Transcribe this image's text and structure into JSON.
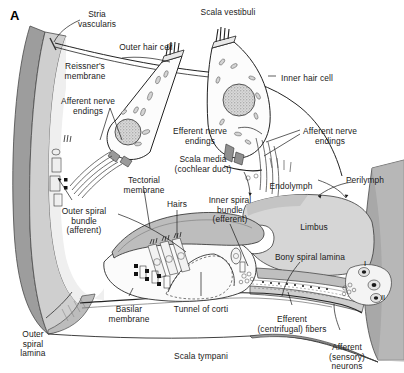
{
  "figure": {
    "panel_letter": "A",
    "colors": {
      "outer_wall_dark": "#9a9a9a",
      "outer_wall_mid": "#c4c4c4",
      "scala_fill": "#ffffff",
      "limbus_fill": "#d8d8d8",
      "lamina_fill": "#b0b0b0",
      "tectorial_fill": "#bdbdbd",
      "stroke": "#1a1a1a",
      "text": "#1a1a1a"
    }
  },
  "labels": [
    {
      "id": "scala-vestibuli",
      "text": "Scala vestibuli",
      "x": 228,
      "y": 8,
      "align": "center"
    },
    {
      "id": "stria-vascularis",
      "text": "Stria\nvascularis",
      "x": 97,
      "y": 10,
      "align": "center"
    },
    {
      "id": "outer-hair-cell",
      "text": "Outer hair cell",
      "x": 146,
      "y": 43,
      "align": "center"
    },
    {
      "id": "inner-hair-cell",
      "text": "Inner hair cell",
      "x": 307,
      "y": 74,
      "align": "center"
    },
    {
      "id": "reissners-membrane",
      "text": "Reissner's\nmembrane",
      "x": 85,
      "y": 62,
      "align": "center"
    },
    {
      "id": "afferent-nerve-endings-left",
      "text": "Afferent nerve\nendings",
      "x": 88,
      "y": 97,
      "align": "center"
    },
    {
      "id": "efferent-nerve-endings",
      "text": "Efferent nerve\nendings",
      "x": 200,
      "y": 127,
      "align": "center"
    },
    {
      "id": "afferent-nerve-endings-right",
      "text": "Afferent nerve\nendings",
      "x": 330,
      "y": 127,
      "align": "center"
    },
    {
      "id": "scala-media",
      "text": "Scala media\n(cochlear duct)",
      "x": 203,
      "y": 155,
      "align": "center"
    },
    {
      "id": "endolymph",
      "text": "Endolymph",
      "x": 291,
      "y": 182,
      "align": "center"
    },
    {
      "id": "perilymph",
      "text": "Perilymph",
      "x": 365,
      "y": 176,
      "align": "center"
    },
    {
      "id": "tectorial-membrane",
      "text": "Tectorial\nmembrane",
      "x": 144,
      "y": 176,
      "align": "center"
    },
    {
      "id": "hairs",
      "text": "Hairs",
      "x": 177,
      "y": 200,
      "align": "center"
    },
    {
      "id": "inner-spiral-bundle",
      "text": "Inner spiral\nbundle\n(efferent)",
      "x": 230,
      "y": 196,
      "align": "center"
    },
    {
      "id": "outer-spiral-bundle",
      "text": "Outer spiral\nbundle\n(afferent)",
      "x": 84,
      "y": 207,
      "align": "center"
    },
    {
      "id": "limbus",
      "text": "Limbus",
      "x": 314,
      "y": 223,
      "align": "center"
    },
    {
      "id": "bony-spiral-lamina",
      "text": "Bony spiral lamina",
      "x": 310,
      "y": 253,
      "align": "center"
    },
    {
      "id": "basilar-membrane",
      "text": "Basilar\nmembrane",
      "x": 129,
      "y": 305,
      "align": "center"
    },
    {
      "id": "tunnel-of-corti",
      "text": "Tunnel of corti",
      "x": 201,
      "y": 305,
      "align": "center"
    },
    {
      "id": "outer-spiral-lamina",
      "text": "Outer\nspiral\nlamina",
      "x": 33,
      "y": 330,
      "align": "center"
    },
    {
      "id": "scala-tympani",
      "text": "Scala tympani",
      "x": 201,
      "y": 352,
      "align": "center"
    },
    {
      "id": "efferent-centrifugal-fibers",
      "text": "Efferent\n(centrifugal) fibers",
      "x": 292,
      "y": 315,
      "align": "center"
    },
    {
      "id": "afferent-sensory-neurons",
      "text": "Afferent\n(sensory) neurons",
      "x": 347,
      "y": 343,
      "align": "center"
    }
  ],
  "roman_markers": [
    {
      "id": "neuron-type-i",
      "text": "I",
      "x": 365,
      "y": 263
    },
    {
      "id": "neuron-type-ii",
      "text": "II",
      "x": 381,
      "y": 297
    }
  ]
}
